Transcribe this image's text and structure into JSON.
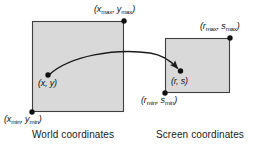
{
  "figure": {
    "background_color": "#ffffff",
    "box_fill_color": "#d9d9d9",
    "box_stroke_color": "#3f3f3f",
    "dot_color": "#111111",
    "arrow_color": "#1a1a1a",
    "text_color": "#111111"
  },
  "world_box": {
    "name": "World coordinates",
    "caption": "World coordinates",
    "corner_max_label": {
      "open": "(",
      "x_base": "x",
      "x_sub": "max",
      "comma": ", ",
      "y_base": "y",
      "y_sub": "max",
      "close": ")"
    },
    "corner_min_label": {
      "open": "(",
      "x_base": "x",
      "x_sub": "min",
      "comma": ", ",
      "y_base": "y",
      "y_sub": "min",
      "close": ")"
    },
    "point_label": "(x, y)",
    "rect": {
      "x": 32,
      "y": 21,
      "width": 92,
      "height": 91
    },
    "point": {
      "x": 48,
      "y": 75
    },
    "corner_max_dot": {
      "x": 124,
      "y": 21
    },
    "corner_min_dot": {
      "x": 32,
      "y": 112
    }
  },
  "screen_box": {
    "name": "Screen coordinates",
    "caption": "Screen coordinates",
    "corner_max_label": {
      "open": "(",
      "x_base": "r",
      "x_sub": "max",
      "comma": ", ",
      "y_base": "s",
      "y_sub": "max",
      "close": ")"
    },
    "corner_min_label": {
      "open": "(",
      "x_base": "r",
      "x_sub": "min",
      "comma": ", ",
      "y_base": "s",
      "y_sub": "min",
      "close": ")"
    },
    "point_label": "(r, s)",
    "rect": {
      "x": 165,
      "y": 38,
      "width": 65,
      "height": 55
    },
    "point": {
      "x": 180,
      "y": 71
    },
    "corner_max_dot": {
      "x": 230,
      "y": 38
    },
    "corner_min_dot": {
      "x": 165,
      "y": 93
    }
  },
  "mapping_arrow": {
    "name": "mapping-arrow",
    "from": {
      "x": 48,
      "y": 75
    },
    "to": {
      "x": 179,
      "y": 70
    },
    "description": "curved arrow from world point to screen point"
  }
}
